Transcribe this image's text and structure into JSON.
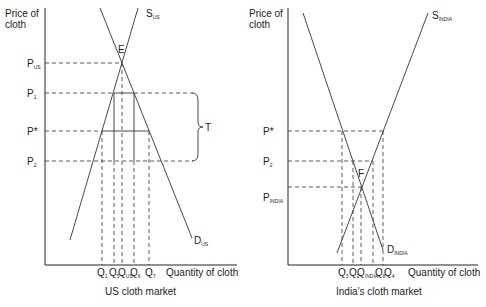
{
  "left_panel": {
    "title": "US cloth market",
    "y_axis_label_line1": "Price of",
    "y_axis_label_line2": "cloth",
    "x_axis_label": "Quantity of cloth",
    "supply_label": "S",
    "supply_sub": "US",
    "demand_label": "D",
    "demand_sub": "US",
    "equilibrium_label": "E",
    "tariff_label": "T",
    "price_labels": [
      {
        "main": "P",
        "sub": "US"
      },
      {
        "main": "P",
        "sub": "1"
      },
      {
        "main": "P*",
        "sub": ""
      },
      {
        "main": "P",
        "sub": "2"
      }
    ],
    "quantity_labels": [
      {
        "main": "Q",
        "sub": "1"
      },
      {
        "main": "Q",
        "sub": "5"
      },
      {
        "main": "Q",
        "sub": "US"
      },
      {
        "main": "Q",
        "sub": "6"
      },
      {
        "main": "Q",
        "sub": "7"
      }
    ]
  },
  "right_panel": {
    "title": "India's cloth market",
    "y_axis_label_line1": "Price of",
    "y_axis_label_line2": "cloth",
    "x_axis_label": "Quantity of cloth",
    "supply_label": "S",
    "supply_sub": "INDIA",
    "demand_label": "D",
    "demand_sub": "INDIA",
    "equilibrium_label": "F",
    "price_labels": [
      {
        "main": "P*",
        "sub": ""
      },
      {
        "main": "P",
        "sub": "2"
      },
      {
        "main": "P",
        "sub": "INDIA"
      }
    ],
    "quantity_labels": [
      {
        "main": "Q",
        "sub": "3"
      },
      {
        "main": "Q",
        "sub": "2"
      },
      {
        "main": "Q",
        "sub": "INDIA"
      },
      {
        "main": "Q",
        "sub": "8"
      },
      {
        "main": "Q",
        "sub": "4"
      }
    ]
  }
}
